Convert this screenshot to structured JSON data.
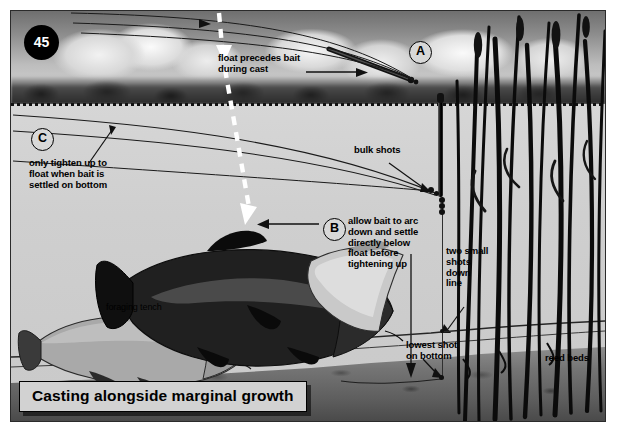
{
  "page": {
    "number": "45"
  },
  "caption": {
    "title": "Casting alongside marginal growth"
  },
  "markers": [
    {
      "id": "A",
      "label": "A"
    },
    {
      "id": "B",
      "label": "B"
    },
    {
      "id": "C",
      "label": "C"
    }
  ],
  "annotations": {
    "float_precedes": "float precedes bait\nduring cast",
    "float_precedes_line1": "float precedes bait",
    "float_precedes_line2": "during cast",
    "tighten_line1": "only tighten up to",
    "tighten_line2": "float when bait is",
    "tighten_line3": "settled on bottom",
    "bulk_shots": "bulk shots",
    "arc_line1": "allow bait to arc",
    "arc_line2": "down and settle",
    "arc_line3": "directly below",
    "arc_line4": "float before",
    "arc_line5": "tightening up",
    "two_small_line1": "two small",
    "two_small_line2": "shots",
    "two_small_line3": "down",
    "two_small_line4": "line",
    "lowest_shot_line1": "lowest shot",
    "lowest_shot_line2": "on bottom",
    "reed_beds": "reed beds",
    "foraging_tench": "foraging tench"
  },
  "colors": {
    "ink": "#000000",
    "water": "#cfcfcf",
    "bed": "#5e5e5e",
    "banner_fill": "#d2d2d2",
    "badge_fill": "#000000",
    "cast_arrow": "#ffffff"
  }
}
